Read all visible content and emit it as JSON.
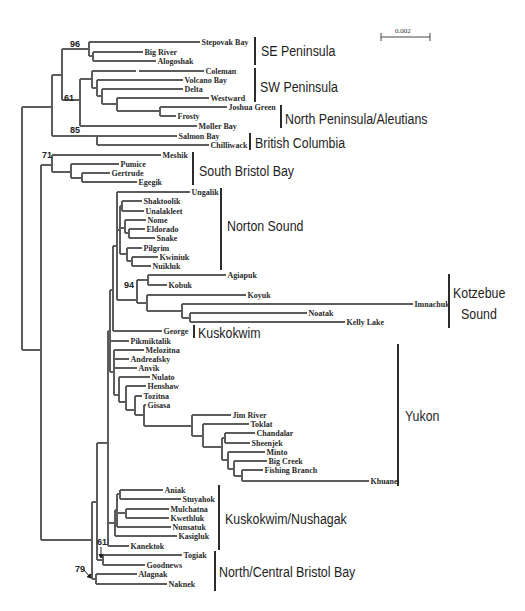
{
  "figure": {
    "type": "phylogenetic-tree",
    "scale_bar": {
      "label": "0.002",
      "x1": 381,
      "x2": 430,
      "y": 37,
      "label_x": 395,
      "label_y": 33
    }
  },
  "tree": {
    "leaves": [
      {
        "name": "Stepovak Bay",
        "y": 42,
        "x1": 89,
        "x2": 200
      },
      {
        "name": "Big River",
        "y": 52,
        "x1": 93,
        "x2": 143
      },
      {
        "name": "Alogoshak",
        "y": 61,
        "x1": 93,
        "x2": 156
      },
      {
        "name": "Coleman",
        "y": 71,
        "x1": 92,
        "x2": 204,
        "gap": [
          136,
          139
        ]
      },
      {
        "name": "Volcano Bay",
        "y": 80,
        "x1": 97,
        "x2": 183
      },
      {
        "name": "Delta",
        "y": 89,
        "x1": 102,
        "x2": 183
      },
      {
        "name": "Westward",
        "y": 98,
        "x1": 117,
        "x2": 209
      },
      {
        "name": "Joshua Green",
        "y": 107,
        "x1": 160,
        "x2": 227
      },
      {
        "name": "Frosty",
        "y": 116,
        "x1": 160,
        "x2": 176
      },
      {
        "name": "Moller Bay",
        "y": 126,
        "x1": 80,
        "x2": 197
      },
      {
        "name": "Salmon Bay",
        "y": 136,
        "x1": 97,
        "x2": 177
      },
      {
        "name": "Chilliwack",
        "y": 145,
        "x1": 97,
        "x2": 209
      },
      {
        "name": "Meshik",
        "y": 155,
        "x1": 52,
        "x2": 161
      },
      {
        "name": "Pumice",
        "y": 164,
        "x1": 71,
        "x2": 119
      },
      {
        "name": "Gertrude",
        "y": 173,
        "x1": 82,
        "x2": 110
      },
      {
        "name": "Egegik",
        "y": 182,
        "x1": 82,
        "x2": 137
      },
      {
        "name": "Ungalik",
        "y": 192,
        "x1": 117,
        "x2": 190
      },
      {
        "name": "Shaktoolik",
        "y": 201,
        "x1": 122,
        "x2": 142
      },
      {
        "name": "Unalakleet",
        "y": 211,
        "x1": 122,
        "x2": 144
      },
      {
        "name": "Nome",
        "y": 220,
        "x1": 125,
        "x2": 146
      },
      {
        "name": "Eldorado",
        "y": 229,
        "x1": 129,
        "x2": 145
      },
      {
        "name": "Snake",
        "y": 238,
        "x1": 129,
        "x2": 155
      },
      {
        "name": "Pilgrim",
        "y": 248,
        "x1": 127,
        "x2": 142
      },
      {
        "name": "Kwiniuk",
        "y": 257,
        "x1": 132,
        "x2": 158
      },
      {
        "name": "Nuikluk",
        "y": 266,
        "x1": 132,
        "x2": 151
      },
      {
        "name": "Agiapuk",
        "y": 275,
        "x1": 148,
        "x2": 226
      },
      {
        "name": "Kobuk",
        "y": 285,
        "x1": 148,
        "x2": 167
      },
      {
        "name": "Koyuk",
        "y": 295,
        "x1": 147,
        "x2": 246
      },
      {
        "name": "Imnachuk",
        "y": 304,
        "x1": 182,
        "x2": 413
      },
      {
        "name": "Noatak",
        "y": 313,
        "x1": 190,
        "x2": 307
      },
      {
        "name": "Kelly Lake",
        "y": 322,
        "x1": 190,
        "x2": 345
      },
      {
        "name": "George",
        "y": 331,
        "x1": 113,
        "x2": 162
      },
      {
        "name": "Pikmiktalik",
        "y": 341,
        "x1": 110,
        "x2": 129
      },
      {
        "name": "Melozitna",
        "y": 350,
        "x1": 114,
        "x2": 144
      },
      {
        "name": "Andreafsky",
        "y": 359,
        "x1": 114,
        "x2": 129
      },
      {
        "name": "Anvik",
        "y": 368,
        "x1": 114,
        "x2": 137
      },
      {
        "name": "Nulato",
        "y": 377,
        "x1": 119,
        "x2": 150
      },
      {
        "name": "Henshaw",
        "y": 386,
        "x1": 126,
        "x2": 146
      },
      {
        "name": "Tozitna",
        "y": 396,
        "x1": 135,
        "x2": 142
      },
      {
        "name": "Gisasa",
        "y": 405,
        "x1": 144,
        "x2": 146
      },
      {
        "name": "Jim River",
        "y": 415,
        "x1": 192,
        "x2": 231
      },
      {
        "name": "Toklat",
        "y": 424,
        "x1": 203,
        "x2": 249
      },
      {
        "name": "Chandalar",
        "y": 433,
        "x1": 225,
        "x2": 255
      },
      {
        "name": "Sheenjek",
        "y": 443,
        "x1": 225,
        "x2": 250
      },
      {
        "name": "Minto",
        "y": 452,
        "x1": 228,
        "x2": 265
      },
      {
        "name": "Big Creek",
        "y": 461,
        "x1": 234,
        "x2": 267
      },
      {
        "name": "Fishing Branch",
        "y": 470,
        "x1": 242,
        "x2": 263
      },
      {
        "name": "Khuane",
        "y": 481,
        "x1": 242,
        "x2": 369
      },
      {
        "name": "Aniak",
        "y": 490,
        "x1": 120,
        "x2": 163
      },
      {
        "name": "Stuyahok",
        "y": 499,
        "x1": 120,
        "x2": 181
      },
      {
        "name": "Mulchatna",
        "y": 509,
        "x1": 126,
        "x2": 169
      },
      {
        "name": "Kwethluk",
        "y": 518,
        "x1": 126,
        "x2": 169
      },
      {
        "name": "Nunsatuk",
        "y": 527,
        "x1": 117,
        "x2": 171
      },
      {
        "name": "Kasigluk",
        "y": 536,
        "x1": 115,
        "x2": 177
      },
      {
        "name": "Kanektok",
        "y": 546,
        "x1": 108,
        "x2": 129
      },
      {
        "name": "Togiak",
        "y": 555,
        "x1": 103,
        "x2": 182
      },
      {
        "name": "Goodnews",
        "y": 565,
        "x1": 103,
        "x2": 145
      },
      {
        "name": "Alagnak",
        "y": 574,
        "x1": 96,
        "x2": 137
      },
      {
        "name": "Naknek",
        "y": 584,
        "x1": 96,
        "x2": 167
      }
    ],
    "internal_branches": [
      [
        89,
        42,
        89,
        56
      ],
      [
        89,
        56,
        93,
        56
      ],
      [
        93,
        52,
        93,
        61
      ],
      [
        62,
        49,
        89,
        49
      ],
      [
        92,
        71,
        92,
        88
      ],
      [
        92,
        88,
        97,
        88
      ],
      [
        97,
        80,
        97,
        96
      ],
      [
        97,
        96,
        102,
        96
      ],
      [
        102,
        89,
        102,
        104
      ],
      [
        102,
        104,
        117,
        104
      ],
      [
        117,
        98,
        117,
        111
      ],
      [
        117,
        111,
        160,
        111
      ],
      [
        160,
        107,
        160,
        116
      ],
      [
        80,
        79,
        92,
        79
      ],
      [
        80,
        79,
        80,
        126
      ],
      [
        62,
        100,
        80,
        100
      ],
      [
        62,
        49,
        62,
        100
      ],
      [
        52,
        75,
        62,
        75
      ],
      [
        52,
        75,
        52,
        136
      ],
      [
        52,
        136,
        97,
        136
      ],
      [
        97,
        136,
        97,
        145
      ],
      [
        22,
        107,
        52,
        107
      ],
      [
        22,
        107,
        22,
        350
      ],
      [
        22,
        350,
        41,
        350
      ],
      [
        41,
        165,
        41,
        540
      ],
      [
        41,
        165,
        52,
        165
      ],
      [
        52,
        155,
        52,
        172
      ],
      [
        52,
        172,
        71,
        172
      ],
      [
        71,
        164,
        71,
        178
      ],
      [
        71,
        178,
        82,
        178
      ],
      [
        82,
        173,
        82,
        182
      ],
      [
        41,
        540,
        92,
        540
      ],
      [
        92,
        502,
        92,
        579
      ],
      [
        92,
        579,
        96,
        579
      ],
      [
        96,
        574,
        96,
        584
      ],
      [
        92,
        502,
        97,
        502
      ],
      [
        97,
        443,
        97,
        560
      ],
      [
        97,
        560,
        103,
        560
      ],
      [
        103,
        555,
        103,
        565
      ],
      [
        97,
        443,
        108,
        443
      ],
      [
        108,
        331,
        108,
        546
      ],
      [
        108,
        331,
        110,
        331
      ],
      [
        110,
        290,
        110,
        372
      ],
      [
        110,
        290,
        113,
        290
      ],
      [
        113,
        246,
        113,
        331
      ],
      [
        113,
        246,
        117,
        246
      ],
      [
        117,
        192,
        117,
        300
      ],
      [
        117,
        230,
        120,
        230
      ],
      [
        120,
        206,
        120,
        254
      ],
      [
        120,
        206,
        122,
        206
      ],
      [
        122,
        201,
        122,
        211
      ],
      [
        120,
        228,
        125,
        228
      ],
      [
        125,
        220,
        125,
        233
      ],
      [
        125,
        233,
        129,
        233
      ],
      [
        129,
        229,
        129,
        238
      ],
      [
        120,
        254,
        127,
        254
      ],
      [
        127,
        248,
        127,
        261
      ],
      [
        127,
        261,
        132,
        261
      ],
      [
        132,
        257,
        132,
        266
      ],
      [
        117,
        300,
        137,
        300
      ],
      [
        137,
        280,
        137,
        303
      ],
      [
        137,
        280,
        148,
        280
      ],
      [
        148,
        275,
        148,
        285
      ],
      [
        137,
        303,
        147,
        303
      ],
      [
        147,
        295,
        147,
        311
      ],
      [
        147,
        311,
        182,
        311
      ],
      [
        182,
        304,
        182,
        318
      ],
      [
        182,
        318,
        190,
        318
      ],
      [
        190,
        313,
        190,
        322
      ],
      [
        110,
        372,
        114,
        372
      ],
      [
        114,
        350,
        114,
        395
      ],
      [
        114,
        395,
        119,
        395
      ],
      [
        119,
        377,
        119,
        402
      ],
      [
        119,
        402,
        126,
        402
      ],
      [
        126,
        386,
        126,
        410
      ],
      [
        126,
        410,
        135,
        410
      ],
      [
        135,
        396,
        135,
        415
      ],
      [
        135,
        415,
        144,
        415
      ],
      [
        144,
        405,
        144,
        426
      ],
      [
        144,
        426,
        192,
        426
      ],
      [
        192,
        415,
        192,
        436
      ],
      [
        192,
        436,
        203,
        436
      ],
      [
        203,
        424,
        203,
        447
      ],
      [
        203,
        447,
        222,
        447
      ],
      [
        222,
        438,
        222,
        460
      ],
      [
        222,
        438,
        225,
        438
      ],
      [
        225,
        433,
        225,
        443
      ],
      [
        222,
        460,
        228,
        460
      ],
      [
        228,
        452,
        228,
        469
      ],
      [
        228,
        469,
        234,
        469
      ],
      [
        234,
        461,
        234,
        476
      ],
      [
        234,
        476,
        242,
        476
      ],
      [
        242,
        470,
        242,
        481
      ],
      [
        108,
        523,
        115,
        523
      ],
      [
        115,
        510,
        115,
        536
      ],
      [
        115,
        510,
        117,
        510
      ],
      [
        117,
        494,
        117,
        527
      ],
      [
        117,
        494,
        120,
        494
      ],
      [
        120,
        490,
        120,
        499
      ],
      [
        117,
        513,
        126,
        513
      ],
      [
        126,
        509,
        126,
        518
      ]
    ],
    "bootstrap": [
      {
        "value": "96",
        "x": 70,
        "y": 47
      },
      {
        "value": "61",
        "x": 64,
        "y": 101
      },
      {
        "value": "85",
        "x": 70,
        "y": 133
      },
      {
        "value": "71",
        "x": 42,
        "y": 158
      },
      {
        "value": "94",
        "x": 124,
        "y": 288
      },
      {
        "value": "61",
        "x": 97,
        "y": 545
      },
      {
        "value": "79",
        "x": 75,
        "y": 572
      }
    ],
    "arrows": [
      {
        "for": "61",
        "x1": 101,
        "y1": 547,
        "x2": 101,
        "y2": 558
      },
      {
        "for": "79",
        "x1": 84,
        "y1": 570,
        "x2": 91,
        "y2": 578
      }
    ]
  },
  "groups": [
    {
      "label": "SE Peninsula",
      "bar_x": 255,
      "y1": 37,
      "y2": 65,
      "label_x": 261,
      "label_y": 56
    },
    {
      "label": "SW Peninsula",
      "bar_x": 255,
      "y1": 68,
      "y2": 102,
      "label_x": 260,
      "label_y": 92
    },
    {
      "label": "North Peninsula/Aleutians",
      "bar_x": 281,
      "y1": 105,
      "y2": 128,
      "label_x": 285,
      "label_y": 124
    },
    {
      "label": "British Columbia",
      "bar_x": 250,
      "y1": 133,
      "y2": 150,
      "label_x": 255,
      "label_y": 148
    },
    {
      "label": "South Bristol Bay",
      "bar_x": 193,
      "y1": 152,
      "y2": 185,
      "label_x": 199,
      "label_y": 176
    },
    {
      "label": "Norton Sound",
      "bar_x": 221,
      "y1": 188,
      "y2": 270,
      "label_x": 227,
      "label_y": 231
    },
    {
      "label": "Kotzebue",
      "label2": "Sound",
      "bar_x": 449,
      "y1": 274,
      "y2": 328,
      "label_x": 453,
      "label_y": 298,
      "label2_x": 461,
      "label2_y": 319
    },
    {
      "label": "Kuskokwim",
      "bar_x": 194,
      "y1": 325,
      "y2": 338,
      "label_x": 198,
      "label_y": 338
    },
    {
      "label": "Yukon",
      "bar_x": 398,
      "y1": 344,
      "y2": 486,
      "label_x": 405,
      "label_y": 421
    },
    {
      "label": "Kuskokwim/Nushagak",
      "bar_x": 219,
      "y1": 485,
      "y2": 550,
      "label_x": 225,
      "label_y": 524
    },
    {
      "label": "North/Central Bristol Bay",
      "bar_x": 215,
      "y1": 551,
      "y2": 591,
      "label_x": 219,
      "label_y": 577
    }
  ]
}
